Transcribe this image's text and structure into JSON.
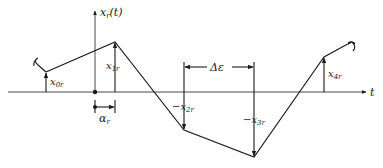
{
  "diagram": {
    "type": "piecewise-linear signal with dimension annotations",
    "axes": {
      "horizontal_label": "t",
      "vertical_label": "x",
      "vertical_label_sub": "r",
      "vertical_label_arg": "(t)"
    },
    "points": [
      {
        "name": "x0",
        "label_prefix": "x",
        "label_sub": "0r"
      },
      {
        "name": "x1",
        "label_prefix": "x",
        "label_sub": "1r"
      },
      {
        "name": "x2",
        "label_prefix": "−x",
        "label_sub": "2r"
      },
      {
        "name": "x3",
        "label_prefix": "−x",
        "label_sub": "3r"
      },
      {
        "name": "x4",
        "label_prefix": "x",
        "label_sub": "4r"
      }
    ],
    "offset_label": "α",
    "offset_label_sub": "r",
    "interval_label": "Δε",
    "colors": {
      "line": "#1a1a1a",
      "background": "#ffffff"
    }
  }
}
